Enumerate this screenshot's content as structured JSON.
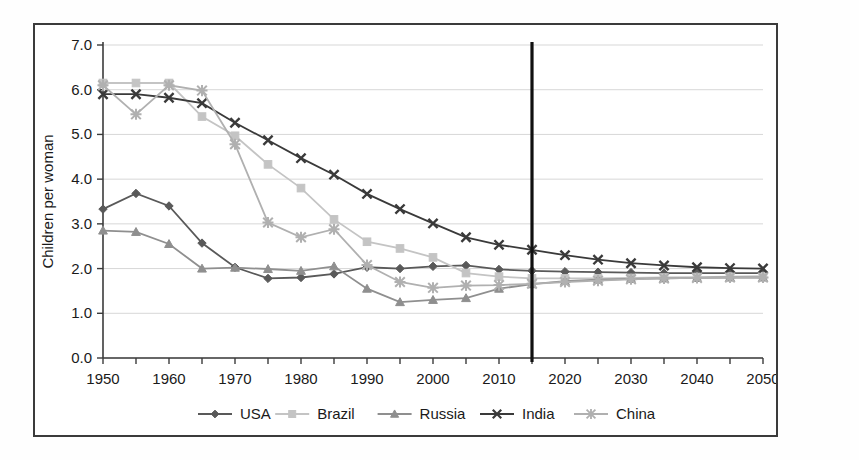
{
  "chart_data": {
    "type": "line",
    "title": "",
    "xlabel": "",
    "ylabel": "Children per woman",
    "xlim": [
      1950,
      2050
    ],
    "ylim": [
      0.0,
      7.0
    ],
    "ytick_step": 1.0,
    "xtick_major_step": 10,
    "xtick_minor_step": 5,
    "grid": "horizontal",
    "legend_position": "bottom",
    "x": [
      1950,
      1955,
      1960,
      1965,
      1970,
      1975,
      1980,
      1985,
      1990,
      1995,
      2000,
      2005,
      2010,
      2015,
      2020,
      2025,
      2030,
      2035,
      2040,
      2045,
      2050
    ],
    "xtick_labels": [
      "1950",
      "1960",
      "1970",
      "1980",
      "1990",
      "2000",
      "2010",
      "2020",
      "2030",
      "2040",
      "2050"
    ],
    "ytick_labels": [
      "0.0",
      "1.0",
      "2.0",
      "3.0",
      "4.0",
      "5.0",
      "6.0",
      "7.0"
    ],
    "annotations": [
      {
        "name": "present-day-divider",
        "type": "vline",
        "x": 2015,
        "color": "#101010"
      }
    ],
    "series": [
      {
        "name": "USA",
        "marker": "diamond",
        "color": "#595959",
        "values": [
          3.33,
          3.68,
          3.4,
          2.57,
          2.03,
          1.78,
          1.8,
          1.88,
          2.03,
          2.0,
          2.05,
          2.07,
          1.98,
          1.95,
          1.93,
          1.92,
          1.91,
          1.9,
          1.9,
          1.9,
          1.9
        ]
      },
      {
        "name": "Brazil",
        "marker": "square",
        "color": "#c4c4c4",
        "values": [
          6.15,
          6.15,
          6.15,
          5.4,
          4.97,
          4.33,
          3.8,
          3.1,
          2.6,
          2.45,
          2.25,
          1.9,
          1.82,
          1.78,
          1.78,
          1.78,
          1.79,
          1.8,
          1.81,
          1.82,
          1.83
        ]
      },
      {
        "name": "Russia",
        "marker": "triangle",
        "color": "#8f8f8f",
        "values": [
          2.85,
          2.82,
          2.55,
          2.0,
          2.02,
          1.99,
          1.95,
          2.05,
          1.55,
          1.25,
          1.3,
          1.34,
          1.55,
          1.65,
          1.72,
          1.75,
          1.77,
          1.78,
          1.79,
          1.8,
          1.8
        ]
      },
      {
        "name": "India",
        "marker": "x",
        "color": "#3a3a3a",
        "values": [
          5.9,
          5.9,
          5.82,
          5.7,
          5.26,
          4.87,
          4.47,
          4.1,
          3.67,
          3.33,
          3.01,
          2.7,
          2.53,
          2.42,
          2.3,
          2.2,
          2.12,
          2.07,
          2.03,
          2.01,
          2.0
        ]
      },
      {
        "name": "China",
        "marker": "star",
        "color": "#b0b0b0",
        "values": [
          6.1,
          5.45,
          6.1,
          5.98,
          4.78,
          3.03,
          2.7,
          2.88,
          2.08,
          1.7,
          1.57,
          1.62,
          1.63,
          1.66,
          1.7,
          1.73,
          1.76,
          1.78,
          1.79,
          1.8,
          1.8
        ]
      }
    ]
  },
  "legend": {
    "items": [
      {
        "label": "USA"
      },
      {
        "label": "Brazil"
      },
      {
        "label": "Russia"
      },
      {
        "label": "India"
      },
      {
        "label": "China"
      }
    ]
  }
}
